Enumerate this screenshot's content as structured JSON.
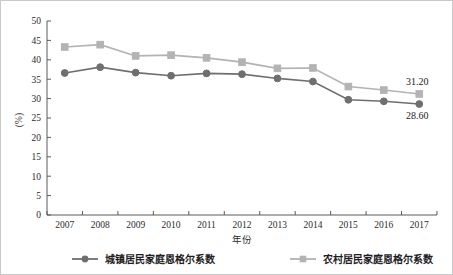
{
  "chart_data": {
    "type": "line",
    "title": "",
    "xlabel": "年份",
    "ylabel": "(%)",
    "ylim": [
      0,
      50
    ],
    "ytick_step": 5,
    "yticks": [
      "0",
      "5",
      "10",
      "15",
      "20",
      "25",
      "30",
      "35",
      "40",
      "45",
      "50"
    ],
    "grid": false,
    "legend_position": "bottom",
    "categories": [
      "2007",
      "2008",
      "2009",
      "2010",
      "2011",
      "2012",
      "2013",
      "2014",
      "2015",
      "2016",
      "2017"
    ],
    "series": [
      {
        "name": "城镇居民家庭恩格尔系数",
        "marker": "circle",
        "color": "#6f6f6f",
        "values": [
          36.6,
          38.1,
          36.7,
          35.9,
          36.5,
          36.3,
          35.2,
          34.4,
          29.7,
          29.3,
          28.6
        ]
      },
      {
        "name": "农村居民家庭恩格尔系数",
        "marker": "square",
        "color": "#b3b3b3",
        "values": [
          43.3,
          43.9,
          41.0,
          41.2,
          40.5,
          39.4,
          37.8,
          37.9,
          33.1,
          32.2,
          31.2
        ]
      }
    ],
    "annotations": [
      {
        "text": "31.20",
        "series": "农村居民家庭恩格尔系数",
        "category": "2017",
        "value": 31.2
      },
      {
        "text": "28.60",
        "series": "城镇居民家庭恩格尔系数",
        "category": "2017",
        "value": 28.6
      }
    ]
  },
  "legend": {
    "items": [
      {
        "label": "城镇居民家庭恩格尔系数",
        "marker": "circle",
        "color": "#6f6f6f"
      },
      {
        "label": "农村居民家庭恩格尔系数",
        "marker": "square",
        "color": "#b3b3b3"
      }
    ]
  },
  "axes": {
    "y_axis_title": "(%)",
    "x_axis_title": "年份"
  }
}
